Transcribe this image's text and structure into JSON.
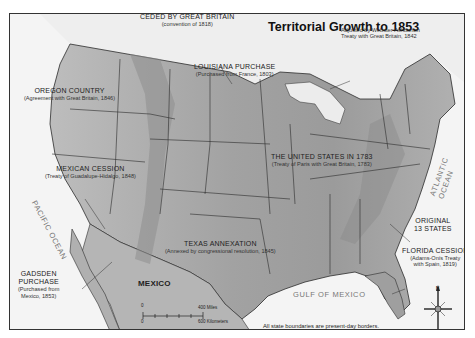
{
  "map": {
    "title": "Territorial Growth to 1853",
    "countries": {
      "north": "CANADA",
      "south": "MEXICO"
    },
    "water_bodies": {
      "pacific": "PACIFIC OCEAN",
      "atlantic": "ATLANTIC OCEAN",
      "gulf": "GULF OF MEXICO"
    },
    "regions": [
      {
        "name": "CEDED BY GREAT BRITAIN",
        "detail": "(convention of 1818)"
      },
      {
        "name": "OREGON COUNTRY",
        "detail": "(Agreement with Great Britain, 1846)"
      },
      {
        "name": "LOUISIANA PURCHASE",
        "detail": "(Purchased from France, 1803)"
      },
      {
        "name": "MEXICAN CESSION",
        "detail": "(Treaty of Guadalupe-Hidalgo, 1848)"
      },
      {
        "name": "THE UNITED STATES IN 1783",
        "detail": "(Treaty of Paris with Great Britain, 1783)"
      },
      {
        "name": "TEXAS ANNEXATION",
        "detail": "(Annexed by congressional resolution, 1845)"
      },
      {
        "name": "GADSDEN PURCHASE",
        "detail": "(Purchased from Mexico, 1853)",
        "lines": [
          "GADSDEN",
          "PURCHASE",
          "(Purchased from",
          "Mexico, 1853)"
        ]
      },
      {
        "name": "ORIGINAL 13 STATES",
        "lines": [
          "ORIGINAL",
          "13 STATES"
        ]
      },
      {
        "name": "FLORIDA CESSION",
        "detail": "(Adams-Onís Treaty with Spain, 1819)",
        "lines": [
          "(Adams-Onís Treaty",
          "with Spain, 1819)"
        ]
      }
    ],
    "annotations": {
      "webster_ashburton": [
        "Adjusted by Webster-Ashburton",
        "Treaty with Great Britain, 1842"
      ],
      "boundaries_note": "All state boundaries are present-day borders."
    },
    "scale_bar": {
      "zero": "0",
      "miles_value": "400",
      "miles_unit": "Miles",
      "km_value": "600",
      "km_unit": "Kilometers"
    },
    "compass": {
      "north": "N"
    },
    "colors": {
      "land": "#a9a9a9",
      "land_light": "#c4c4c4",
      "water": "#f3f3f3",
      "border": "#2b2b2b",
      "mountain": "#8a8a8a"
    }
  }
}
